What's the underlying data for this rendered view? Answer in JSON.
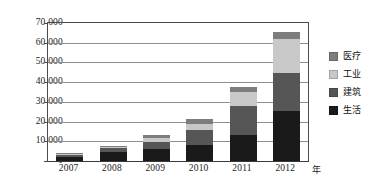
{
  "chart_data": {
    "type": "bar",
    "stacked": true,
    "title": "",
    "xlabel": "年",
    "ylabel": "",
    "categories": [
      "2007",
      "2008",
      "2009",
      "2010",
      "2011",
      "2012"
    ],
    "series": [
      {
        "name": "生活",
        "color": "#1a1a1a",
        "values": [
          2000,
          4500,
          6200,
          8000,
          13000,
          25500
        ]
      },
      {
        "name": "建筑",
        "color": "#565656",
        "values": [
          1300,
          2000,
          3700,
          7500,
          15000,
          19000
        ]
      },
      {
        "name": "工业",
        "color": "#c8c8c8",
        "values": [
          400,
          600,
          1700,
          3500,
          7000,
          17500
        ]
      },
      {
        "name": "医疗",
        "color": "#7d7d7d",
        "values": [
          500,
          600,
          1400,
          2500,
          2800,
          3200
        ]
      }
    ],
    "totals": [
      4200,
      7700,
      13000,
      21500,
      37800,
      65200
    ],
    "ylim": [
      0,
      70000
    ],
    "ytick_step": 10000,
    "ytick_labels": [
      "0",
      "10 000",
      "20 000",
      "30 000",
      "40 000",
      "50 000",
      "60 000",
      "70 000"
    ],
    "ytick_values": [
      0,
      10000,
      20000,
      30000,
      40000,
      50000,
      60000,
      70000
    ],
    "grid": true,
    "legend_position": "right",
    "legend_order": [
      "医疗",
      "工业",
      "建筑",
      "生活"
    ]
  },
  "legend": {
    "items": [
      {
        "label": "医疗",
        "color": "#7d7d7d"
      },
      {
        "label": "工业",
        "color": "#c8c8c8"
      },
      {
        "label": "建筑",
        "color": "#565656"
      },
      {
        "label": "生活",
        "color": "#1a1a1a"
      }
    ]
  },
  "axis": {
    "x_unit": "年"
  }
}
